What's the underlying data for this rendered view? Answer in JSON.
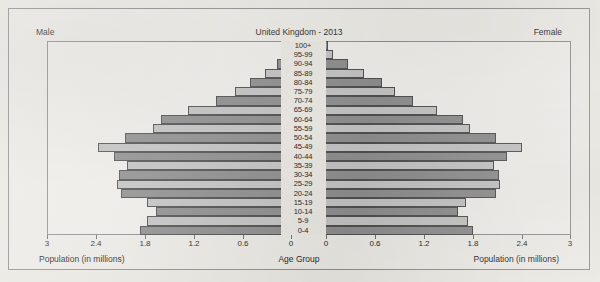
{
  "figure": {
    "title": "United Kingdom - 2013",
    "left_side_label": "Male",
    "right_side_label": "Female",
    "left_axis_caption": "Population (in millions)",
    "right_axis_caption": "Population (in millions)",
    "center_axis_caption": "Age Group"
  },
  "style": {
    "bar_dark": "#8d8d8d",
    "bar_light": "#c2c2c2",
    "bar_outline": "#4e4e4e",
    "frame": "#8d8d8d",
    "paper": "#e9e7e1",
    "text": "#1d1d1d"
  },
  "chart_data": {
    "type": "bar",
    "subtype": "population-pyramid",
    "title": "United Kingdom - 2013",
    "xlabel": "Population (in millions)",
    "ylabel": "Age Group",
    "xlim": [
      0,
      3
    ],
    "xticks": [
      3,
      2.4,
      1.8,
      1.2,
      0.6,
      0
    ],
    "xticklabels_left": [
      "3",
      "2.4",
      "1.8",
      "1.2",
      "0.6",
      "0"
    ],
    "xticklabels_right": [
      "0",
      "0.6",
      "1.2",
      "1.8",
      "2.4",
      "3"
    ],
    "grid": false,
    "legend": "none",
    "categories": [
      "100+",
      "95-99",
      "90-94",
      "85-89",
      "80-84",
      "75-79",
      "70-74",
      "65-69",
      "60-64",
      "55-59",
      "50-54",
      "45-49",
      "40-44",
      "35-39",
      "30-34",
      "25-29",
      "20-24",
      "15-19",
      "10-14",
      "5-9",
      "0-4"
    ],
    "series": [
      {
        "name": "Male",
        "side": "left",
        "values": [
          0.01,
          0.06,
          0.18,
          0.33,
          0.52,
          0.7,
          0.93,
          1.27,
          1.6,
          1.7,
          2.04,
          2.38,
          2.18,
          2.02,
          2.12,
          2.14,
          2.1,
          1.78,
          1.66,
          1.78,
          1.86
        ]
      },
      {
        "name": "Female",
        "side": "right",
        "values": [
          0.02,
          0.09,
          0.27,
          0.47,
          0.68,
          0.85,
          1.06,
          1.36,
          1.68,
          1.76,
          2.08,
          2.4,
          2.22,
          2.06,
          2.12,
          2.13,
          2.08,
          1.72,
          1.62,
          1.74,
          1.8
        ]
      }
    ]
  }
}
